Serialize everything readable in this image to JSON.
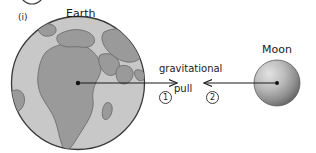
{
  "figure": {
    "part_label": "(i)",
    "earth_label": "Earth",
    "moon_label": "Moon",
    "force_label_line1": "gravitational",
    "force_label_line2": "pull",
    "arrow_marker_1": "1",
    "arrow_marker_2": "2"
  },
  "colors": {
    "background": "#ffffff",
    "ocean": "#c8c8c8",
    "land": "#9a9a9a",
    "outline": "#3a3a3a",
    "arrow": "#1a1a1a",
    "moon_light": "#d8d8d8",
    "moon_dark": "#6a6a6a",
    "text": "#1a1a1a"
  },
  "geometry": {
    "earth_center_x": 78,
    "earth_center_y": 83,
    "earth_radius": 67,
    "moon_center_x": 277,
    "moon_center_y": 83,
    "moon_radius": 23,
    "arrow_left_start_x": 78,
    "arrow_left_end_x": 177,
    "arrow_right_start_x": 275,
    "arrow_right_end_x": 204,
    "arrow_y": 83,
    "top_circle_center_x": 32,
    "top_circle_center_y": -8,
    "top_circle_radius": 12
  }
}
